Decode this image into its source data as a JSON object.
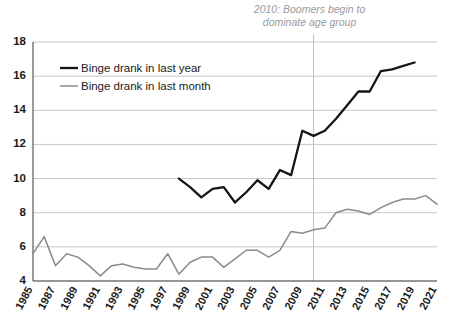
{
  "chart_data": {
    "type": "line",
    "title": "",
    "xlabel": "",
    "ylabel": "",
    "xlim": [
      1985,
      2021
    ],
    "ylim": [
      4,
      18
    ],
    "grid": true,
    "legend_position": "top-left",
    "ytick_labels": [
      "4",
      "6",
      "8",
      "10",
      "12",
      "14",
      "16",
      "18"
    ],
    "yticks": [
      4,
      6,
      8,
      10,
      12,
      14,
      16,
      18
    ],
    "xtick_labels": [
      "1985",
      "1987",
      "1989",
      "1991",
      "1993",
      "1995",
      "1997",
      "1999",
      "2001",
      "2003",
      "2005",
      "2007",
      "2009",
      "2011",
      "2013",
      "2015",
      "2017",
      "2019",
      "2021"
    ],
    "xticks": [
      1985,
      1987,
      1989,
      1991,
      1993,
      1995,
      1997,
      1999,
      2001,
      2003,
      2005,
      2007,
      2009,
      2011,
      2013,
      2015,
      2017,
      2019,
      2021
    ],
    "annotations": [
      {
        "name": "boomers-annotation",
        "line1": "2010: Boomers begin to",
        "line2": "dominate age group",
        "marker_x": 2010
      }
    ],
    "series": [
      {
        "name": "Binge drank in last year",
        "color": "#16161a",
        "x": [
          1998,
          1999,
          2000,
          2001,
          2002,
          2003,
          2004,
          2005,
          2006,
          2007,
          2008,
          2009,
          2010,
          2011,
          2012,
          2013,
          2014,
          2015,
          2016,
          2017,
          2018,
          2019
        ],
        "values": [
          10.0,
          9.5,
          8.9,
          9.4,
          9.5,
          8.6,
          9.2,
          9.9,
          9.4,
          10.5,
          10.2,
          12.8,
          12.5,
          12.8,
          13.5,
          14.3,
          15.1,
          15.1,
          16.3,
          16.4,
          16.6,
          16.8
        ]
      },
      {
        "name": "Binge drank in last month",
        "color": "#8a8a90",
        "x": [
          1985,
          1986,
          1987,
          1988,
          1989,
          1990,
          1991,
          1992,
          1993,
          1994,
          1995,
          1996,
          1997,
          1998,
          1999,
          2000,
          2001,
          2002,
          2003,
          2004,
          2005,
          2006,
          2007,
          2008,
          2009,
          2010,
          2011,
          2012,
          2013,
          2014,
          2015,
          2016,
          2017,
          2018,
          2019,
          2020,
          2021
        ],
        "values": [
          5.6,
          6.6,
          4.9,
          5.6,
          5.4,
          4.9,
          4.3,
          4.9,
          5.0,
          4.8,
          4.7,
          4.7,
          5.6,
          4.4,
          5.1,
          5.4,
          5.4,
          4.8,
          5.3,
          5.8,
          5.8,
          5.4,
          5.8,
          6.9,
          6.8,
          7.0,
          7.1,
          8.0,
          8.2,
          8.1,
          7.9,
          8.3,
          8.6,
          8.8,
          8.8,
          9.0,
          8.5
        ]
      }
    ],
    "legend": [
      {
        "label": "Binge drank in last year",
        "style": "thick-black"
      },
      {
        "label": "Binge drank in last month",
        "style": "thin-gray"
      }
    ]
  }
}
